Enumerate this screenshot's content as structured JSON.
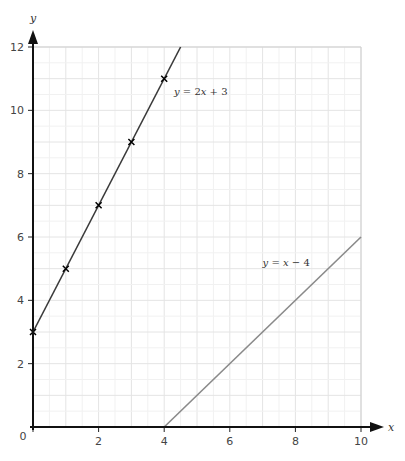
{
  "chart_data": {
    "type": "line",
    "title": "",
    "xlabel": "x",
    "ylabel": "y",
    "xlim": [
      0,
      10
    ],
    "ylim": [
      0,
      12
    ],
    "grid": true,
    "grid_minor_step": 1,
    "x_ticks": [
      0,
      2,
      4,
      6,
      8,
      10
    ],
    "y_ticks": [
      2,
      4,
      6,
      8,
      10,
      12
    ],
    "origin_label": "0",
    "series": [
      {
        "name": "y = 2x + 3",
        "label_parts": {
          "y": "y",
          "eq": " = 2",
          "x": "x",
          "rest": " + 3"
        },
        "color": "#3a3a3a",
        "line_from": [
          0,
          3
        ],
        "line_to": [
          4.5,
          12
        ],
        "points": [
          [
            0,
            3
          ],
          [
            1,
            5
          ],
          [
            2,
            7
          ],
          [
            3,
            9
          ],
          [
            4,
            11
          ]
        ],
        "marker": "x"
      },
      {
        "name": "y = x − 4",
        "label_parts": {
          "y": "y",
          "eq": " = ",
          "x": "x",
          "rest": " − 4"
        },
        "color": "#8a8a8a",
        "line_from": [
          4,
          0
        ],
        "line_to": [
          10,
          6
        ],
        "points": [],
        "marker": "none"
      }
    ]
  }
}
